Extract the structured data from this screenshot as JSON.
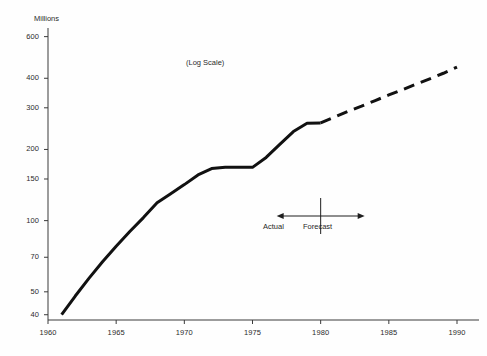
{
  "chart_data": {
    "type": "line",
    "title": "",
    "subtitle": "",
    "annotation_scale": "(Log Scale)",
    "ylabel": "Millions",
    "xlabel": "",
    "log_scale": true,
    "grid": false,
    "legend": "none",
    "xlim": [
      1960,
      1990
    ],
    "ylim": [
      38,
      640
    ],
    "ytick_labels": [
      "600",
      "400",
      "300",
      "200",
      "150",
      "100",
      "70",
      "50",
      "40"
    ],
    "ytick_values": [
      600,
      400,
      300,
      200,
      150,
      100,
      70,
      50,
      40
    ],
    "xtick_labels": [
      "1960",
      "1965",
      "1970",
      "1975",
      "1980",
      "1985",
      "1990"
    ],
    "xtick_values": [
      1960,
      1965,
      1970,
      1975,
      1980,
      1985,
      1990
    ],
    "series": [
      {
        "name": "Actual",
        "style": "solid",
        "color": "#111111",
        "x": [
          1961,
          1962,
          1963,
          1964,
          1965,
          1966,
          1967,
          1968,
          1969,
          1970,
          1971,
          1972,
          1973,
          1974,
          1975,
          1976,
          1977,
          1978,
          1979,
          1980
        ],
        "values": [
          40,
          48,
          57,
          67,
          78,
          90,
          103,
          119,
          130,
          142,
          156,
          166,
          168,
          168,
          168,
          185,
          210,
          238,
          258,
          259
        ]
      },
      {
        "name": "Forecast",
        "style": "dashed",
        "color": "#111111",
        "x": [
          1980,
          1981,
          1982,
          1983,
          1984,
          1985,
          1986,
          1987,
          1988,
          1989,
          1990
        ],
        "values": [
          259,
          274,
          290,
          305,
          322,
          340,
          358,
          378,
          398,
          420,
          446
        ]
      }
    ],
    "annotations": [
      {
        "name": "actual-forecast-divider",
        "type": "double-arrow",
        "x_center": 1980,
        "left_label": "Actual",
        "right_label": "Forecast"
      }
    ]
  },
  "axis": {
    "ylabel": "Millions",
    "log_note": "(Log Scale)"
  },
  "annotations": {
    "actual_label": "Actual",
    "forecast_label": "Forecast"
  },
  "colors": {
    "line": "#111111",
    "axis": "#3a3a3a",
    "text": "#2b2b2b",
    "background": "#fefefe"
  }
}
